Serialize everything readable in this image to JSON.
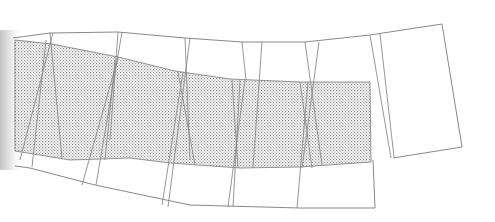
{
  "diagram": {
    "type": "folded-plane line drawing",
    "colors": {
      "line": "#7a7a7a",
      "fold_line": "#8a8a8a",
      "hatch_dot": "#8c8c8c",
      "background": "#ffffff"
    },
    "outer_outline": {
      "top": [
        [
          13,
          38
        ],
        [
          50,
          33
        ],
        [
          118,
          32
        ],
        [
          185,
          38
        ],
        [
          242,
          42
        ],
        [
          305,
          42
        ],
        [
          370,
          35
        ],
        [
          442,
          24
        ]
      ],
      "right": [
        [
          442,
          24
        ],
        [
          462,
          147
        ],
        [
          393,
          158
        ]
      ],
      "bottom": [
        [
          15,
          166
        ],
        [
          30,
          168
        ],
        [
          95,
          185
        ],
        [
          190,
          205
        ],
        [
          263,
          207
        ],
        [
          300,
          208
        ],
        [
          375,
          208
        ],
        [
          373,
          160
        ]
      ]
    },
    "shaded_region": {
      "polygon": [
        [
          15,
          40
        ],
        [
          52,
          44
        ],
        [
          118,
          57
        ],
        [
          175,
          71
        ],
        [
          230,
          79
        ],
        [
          300,
          82
        ],
        [
          370,
          82
        ],
        [
          371,
          162
        ],
        [
          300,
          167
        ],
        [
          240,
          168
        ],
        [
          170,
          163
        ],
        [
          130,
          158
        ],
        [
          70,
          160
        ],
        [
          15,
          151
        ]
      ],
      "pattern": "stipple"
    },
    "fold_lines": [
      [
        [
          50,
          33
        ],
        [
          62,
          158
        ]
      ],
      [
        [
          53,
          33
        ],
        [
          20,
          160
        ]
      ],
      [
        [
          46,
          40
        ],
        [
          32,
          167
        ]
      ],
      [
        [
          118,
          32
        ],
        [
          110,
          140
        ]
      ],
      [
        [
          122,
          32
        ],
        [
          96,
          185
        ]
      ],
      [
        [
          118,
          58
        ],
        [
          82,
          185
        ]
      ],
      [
        [
          115,
          60
        ],
        [
          105,
          160
        ]
      ],
      [
        [
          185,
          38
        ],
        [
          190,
          160
        ]
      ],
      [
        [
          190,
          38
        ],
        [
          168,
          207
        ]
      ],
      [
        [
          183,
          72
        ],
        [
          162,
          205
        ]
      ],
      [
        [
          178,
          72
        ],
        [
          195,
          165
        ]
      ],
      [
        [
          242,
          42
        ],
        [
          246,
          80
        ]
      ],
      [
        [
          262,
          42
        ],
        [
          253,
          168
        ]
      ],
      [
        [
          240,
          80
        ],
        [
          233,
          207
        ]
      ],
      [
        [
          245,
          80
        ],
        [
          228,
          207
        ]
      ],
      [
        [
          232,
          80
        ],
        [
          238,
          168
        ]
      ],
      [
        [
          305,
          42
        ],
        [
          322,
          165
        ]
      ],
      [
        [
          319,
          42
        ],
        [
          302,
          168
        ]
      ],
      [
        [
          308,
          82
        ],
        [
          297,
          208
        ]
      ],
      [
        [
          300,
          82
        ],
        [
          312,
          168
        ]
      ],
      [
        [
          370,
          35
        ],
        [
          391,
          158
        ]
      ],
      [
        [
          380,
          34
        ],
        [
          394,
          157
        ]
      ]
    ]
  }
}
